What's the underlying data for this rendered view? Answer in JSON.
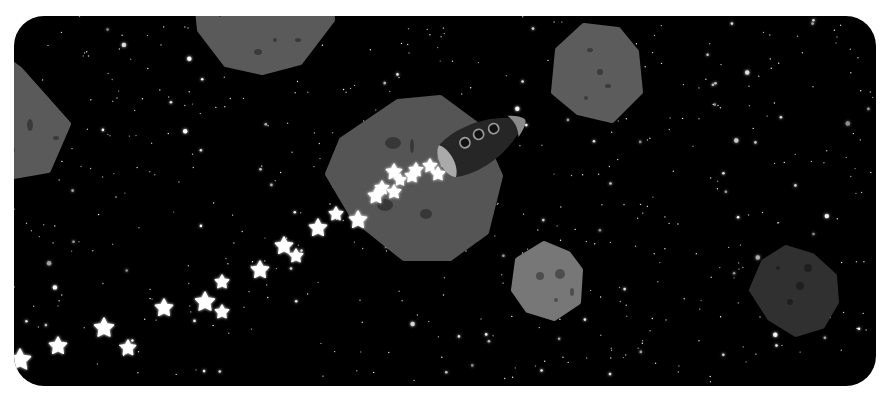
{
  "scene": {
    "background": "#000000",
    "page_background": "#ffffff",
    "panel": {
      "x": 14,
      "y": 16,
      "width": 862,
      "height": 370,
      "radius": 30
    }
  },
  "asteroids": [
    {
      "name": "asteroid-top-center",
      "fill": "#5a5a5a",
      "points": "196,-10 330,-10 332,20 300,62 262,72 226,64 200,30",
      "craters": [
        [
          220,
          10,
          3,
          7
        ],
        [
          258,
          52,
          4,
          3
        ],
        [
          298,
          40,
          3,
          2
        ],
        [
          275,
          40,
          2,
          2
        ]
      ]
    },
    {
      "name": "asteroid-left-edge",
      "fill": "#5a5a5a",
      "points": "-10,50 0,55 20,70 68,124 48,170 -10,180",
      "craters": [
        [
          10,
          150,
          5,
          4
        ],
        [
          30,
          125,
          3,
          6
        ],
        [
          56,
          138,
          3,
          2
        ]
      ]
    },
    {
      "name": "asteroid-top-right",
      "fill": "#5c5c5c",
      "points": "584,26 618,30 636,52 640,92 612,120 578,112 554,92 558,50",
      "craters": [
        [
          590,
          50,
          3,
          2
        ],
        [
          600,
          72,
          3,
          3
        ],
        [
          608,
          86,
          3,
          2
        ],
        [
          586,
          98,
          2,
          2
        ]
      ]
    },
    {
      "name": "asteroid-center-large",
      "fill": "#555555",
      "points": "398,102 440,98 478,126 500,176 486,232 450,258 404,258 354,218 328,174 342,140",
      "craters": [
        [
          393,
          143,
          8,
          6
        ],
        [
          412,
          146,
          2,
          7
        ],
        [
          385,
          205,
          8,
          6
        ],
        [
          426,
          214,
          6,
          5
        ],
        [
          420,
          168,
          3,
          3
        ]
      ]
    },
    {
      "name": "asteroid-bottom-center",
      "fill": "#777777",
      "points": "544,244 568,254 580,270 578,302 554,318 528,310 514,290 518,260",
      "craters": [
        [
          540,
          276,
          4,
          4
        ],
        [
          560,
          274,
          5,
          5
        ],
        [
          572,
          292,
          2,
          4
        ],
        [
          556,
          300,
          2,
          2
        ]
      ]
    },
    {
      "name": "asteroid-bottom-right",
      "fill": "#303030",
      "points": "786,248 812,256 834,276 836,302 822,326 796,334 770,318 752,290 764,262",
      "craters": [
        [
          808,
          268,
          4,
          4
        ],
        [
          800,
          286,
          4,
          4
        ],
        [
          790,
          302,
          3,
          3
        ],
        [
          778,
          268,
          2,
          2
        ]
      ]
    }
  ],
  "rocket": {
    "name": "rocket",
    "body_fill": "#262626",
    "nose_fill": "#8a8a8a",
    "tail_fill": "#aaaaaa",
    "porthole_ring": "#9a9a9a",
    "center": [
      474,
      147
    ],
    "rotation": -28,
    "portholes": [
      [
        -16,
        -8
      ],
      [
        -2,
        -14
      ],
      [
        12,
        -20
      ]
    ]
  },
  "trail_stars": [
    [
      20,
      360,
      11
    ],
    [
      58,
      346,
      9
    ],
    [
      104,
      328,
      10
    ],
    [
      128,
      348,
      8
    ],
    [
      164,
      308,
      9
    ],
    [
      205,
      302,
      10
    ],
    [
      222,
      312,
      7
    ],
    [
      222,
      282,
      7
    ],
    [
      260,
      270,
      9
    ],
    [
      284,
      246,
      9
    ],
    [
      296,
      256,
      7
    ],
    [
      318,
      228,
      9
    ],
    [
      336,
      214,
      7
    ],
    [
      358,
      220,
      9
    ],
    [
      376,
      196,
      8
    ],
    [
      394,
      192,
      7
    ],
    [
      394,
      172,
      8
    ],
    [
      412,
      176,
      7
    ],
    [
      416,
      170,
      7
    ],
    [
      430,
      166,
      7
    ],
    [
      438,
      174,
      7
    ],
    [
      446,
      160,
      7
    ],
    [
      454,
      150,
      6
    ],
    [
      382,
      188,
      7
    ],
    [
      400,
      180,
      6
    ]
  ],
  "stars": []
}
